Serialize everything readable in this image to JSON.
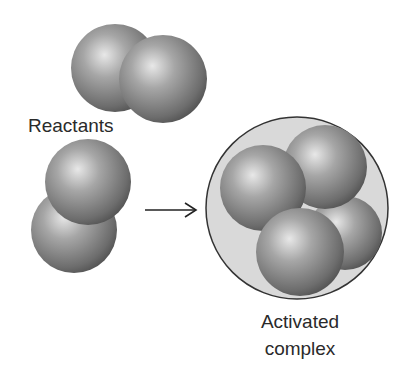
{
  "labels": {
    "reactants": "Reactants",
    "activated_line1": "Activated",
    "activated_line2": "complex"
  },
  "colors": {
    "sphere_light": "#e6e6e6",
    "sphere_mid": "#8e8e8e",
    "sphere_dark": "#4a4a4a",
    "complex_fill": "#d8d8d8",
    "outline": "#333333"
  }
}
